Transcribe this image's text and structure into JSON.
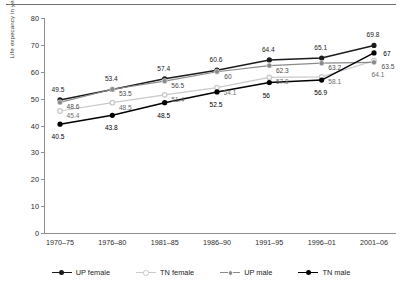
{
  "chart_data": {
    "type": "line",
    "title": "",
    "xlabel": "",
    "ylabel": "Life expecancy in years",
    "ylim": [
      0,
      80
    ],
    "yticks": [
      0,
      10,
      20,
      30,
      40,
      50,
      60,
      70,
      80
    ],
    "grid": false,
    "legend_position": "bottom",
    "categories": [
      "1970–75",
      "1976–80",
      "1981–85",
      "1986–90",
      "1991–95",
      "1996–01",
      "2001–06"
    ],
    "series": [
      {
        "name": "UP female",
        "color": "#1b1b1b",
        "marker": "filled-circle",
        "values": [
          49.5,
          53.4,
          57.4,
          60.6,
          64.4,
          65.1,
          69.8
        ]
      },
      {
        "name": "TN female",
        "color": "#c9c9c9",
        "marker": "open-circle",
        "values": [
          45.4,
          48.5,
          51.4,
          54.1,
          57.9,
          58.1,
          64.1
        ]
      },
      {
        "name": "UP male",
        "color": "#8a8a8a",
        "marker": "dot-circle",
        "values": [
          48.6,
          53.5,
          56.5,
          60.0,
          62.3,
          63.2,
          63.5
        ]
      },
      {
        "name": "TN male",
        "color": "#000000",
        "marker": "filled-circle",
        "values": [
          40.5,
          43.8,
          48.5,
          52.5,
          56.0,
          56.9,
          67.0
        ]
      }
    ],
    "point_labels": [
      {
        "series": "UP female",
        "index": 0,
        "text": "49.5",
        "dx": -2,
        "dy": -11
      },
      {
        "series": "UP female",
        "index": 1,
        "text": "53.4",
        "dx": -1,
        "dy": -11
      },
      {
        "series": "UP female",
        "index": 2,
        "text": "57.4",
        "dx": -1,
        "dy": -11
      },
      {
        "series": "UP female",
        "index": 3,
        "text": "60.6",
        "dx": -1,
        "dy": -11
      },
      {
        "series": "UP female",
        "index": 4,
        "text": "64.4",
        "dx": -1,
        "dy": -11
      },
      {
        "series": "UP female",
        "index": 5,
        "text": "65.1",
        "dx": -1,
        "dy": -11
      },
      {
        "series": "UP female",
        "index": 6,
        "text": "69.8",
        "dx": -1,
        "dy": -11
      },
      {
        "series": "UP male",
        "index": 0,
        "text": "48.6",
        "dx": 13,
        "dy": 4
      },
      {
        "series": "UP male",
        "index": 1,
        "text": "53.5",
        "dx": 13,
        "dy": 4
      },
      {
        "series": "UP male",
        "index": 2,
        "text": "56.5",
        "dx": 13,
        "dy": 4
      },
      {
        "series": "UP male",
        "index": 3,
        "text": "60",
        "dx": 11,
        "dy": 4
      },
      {
        "series": "UP male",
        "index": 4,
        "text": "62.3",
        "dx": 13,
        "dy": 4
      },
      {
        "series": "UP male",
        "index": 5,
        "text": "63.2",
        "dx": 13,
        "dy": 4
      },
      {
        "series": "UP male",
        "index": 6,
        "text": "63.5",
        "dx": 14,
        "dy": 4
      },
      {
        "series": "TN female",
        "index": 0,
        "text": "45.4",
        "dx": 13,
        "dy": 4
      },
      {
        "series": "TN female",
        "index": 1,
        "text": "48.5",
        "dx": 13,
        "dy": 4
      },
      {
        "series": "TN female",
        "index": 2,
        "text": "51.4",
        "dx": 13,
        "dy": 4
      },
      {
        "series": "TN female",
        "index": 3,
        "text": "54.1",
        "dx": 13,
        "dy": 4
      },
      {
        "series": "TN female",
        "index": 4,
        "text": "57.9",
        "dx": 13,
        "dy": 4
      },
      {
        "series": "TN female",
        "index": 5,
        "text": "58.1",
        "dx": 13,
        "dy": 4
      },
      {
        "series": "TN female",
        "index": 6,
        "text": "64.1",
        "dx": 4,
        "dy": 13
      },
      {
        "series": "TN male",
        "index": 0,
        "text": "40.5",
        "dx": -2,
        "dy": 12
      },
      {
        "series": "TN male",
        "index": 1,
        "text": "43.8",
        "dx": -1,
        "dy": 12
      },
      {
        "series": "TN male",
        "index": 2,
        "text": "48.5",
        "dx": -1,
        "dy": 12
      },
      {
        "series": "TN male",
        "index": 3,
        "text": "52.5",
        "dx": -1,
        "dy": 12
      },
      {
        "series": "TN male",
        "index": 4,
        "text": "56",
        "dx": -3,
        "dy": 12
      },
      {
        "series": "TN male",
        "index": 5,
        "text": "56.9",
        "dx": -1,
        "dy": 12
      },
      {
        "series": "TN male",
        "index": 6,
        "text": "67",
        "dx": 13,
        "dy": 0
      }
    ]
  },
  "legend": {
    "items": [
      {
        "label": "UP female"
      },
      {
        "label": "TN female"
      },
      {
        "label": "UP male"
      },
      {
        "label": "TN male"
      }
    ]
  }
}
